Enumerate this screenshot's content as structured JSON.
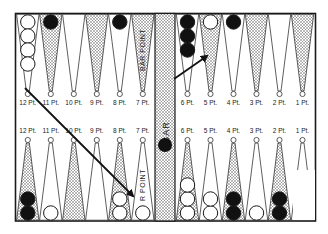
{
  "colors": {
    "frame": "#1a1a1a",
    "background": "#ffffff",
    "shade_dot": "#555555",
    "black_checker": "#111111",
    "white_checker": "#ffffff"
  },
  "bar": {
    "label": "BAR",
    "checkers": [
      {
        "color": "black"
      }
    ]
  },
  "top_row": {
    "points": [
      {
        "label": "12 Pt.",
        "shaded": false,
        "checkers": [
          "white",
          "white",
          "white",
          "white"
        ]
      },
      {
        "label": "11 Pt.",
        "shaded": true,
        "checkers": [
          "black"
        ]
      },
      {
        "label": "10 Pt.",
        "shaded": false,
        "checkers": []
      },
      {
        "label": "9 Pt.",
        "shaded": true,
        "checkers": []
      },
      {
        "label": "8 Pt.",
        "shaded": false,
        "checkers": [
          "black"
        ]
      },
      {
        "label": "7 Pt.",
        "shaded": true,
        "checkers": [],
        "vertical_label": "BAR POINT"
      },
      {
        "label": "6 Pt.",
        "shaded": false,
        "checkers": [
          "black",
          "black",
          "black"
        ]
      },
      {
        "label": "5 Pt.",
        "shaded": true,
        "checkers": [
          "white"
        ]
      },
      {
        "label": "4 Pt.",
        "shaded": false,
        "checkers": [
          "black"
        ]
      },
      {
        "label": "3 Pt.",
        "shaded": true,
        "checkers": []
      },
      {
        "label": "2 Pt.",
        "shaded": false,
        "checkers": []
      },
      {
        "label": "1 Pt.",
        "shaded": true,
        "checkers": []
      }
    ]
  },
  "bottom_row": {
    "points": [
      {
        "label": "12 Pt.",
        "shaded": true,
        "checkers": [
          "black",
          "black"
        ]
      },
      {
        "label": "11 Pt.",
        "shaded": false,
        "checkers": [
          "white"
        ]
      },
      {
        "label": "10 Pt.",
        "shaded": true,
        "checkers": []
      },
      {
        "label": "9 Pt.",
        "shaded": false,
        "checkers": []
      },
      {
        "label": "8 Pt.",
        "shaded": true,
        "checkers": [
          "white",
          "white"
        ]
      },
      {
        "label": "7 Pt.",
        "shaded": false,
        "checkers": [
          "white"
        ],
        "vertical_label": "BAR POINT"
      },
      {
        "label": "6 Pt.",
        "shaded": true,
        "checkers": [
          "white",
          "white",
          "white"
        ]
      },
      {
        "label": "5 Pt.",
        "shaded": false,
        "checkers": [
          "white",
          "white"
        ]
      },
      {
        "label": "4 Pt.",
        "shaded": true,
        "checkers": [
          "black",
          "black"
        ]
      },
      {
        "label": "3 Pt.",
        "shaded": false,
        "checkers": [
          "white"
        ]
      },
      {
        "label": "2 Pt.",
        "shaded": true,
        "checkers": [
          "black",
          "black"
        ]
      },
      {
        "label": "1 Pt.",
        "shaded": false,
        "checkers": []
      }
    ]
  },
  "arrows": [
    {
      "name": "move-arrow-12pt-to-bar-point",
      "from": [
        25,
        88
      ],
      "to": [
        133,
        196
      ]
    },
    {
      "name": "move-arrow-bar-to-5pt",
      "from": [
        174,
        79
      ],
      "to": [
        207,
        56
      ]
    }
  ]
}
